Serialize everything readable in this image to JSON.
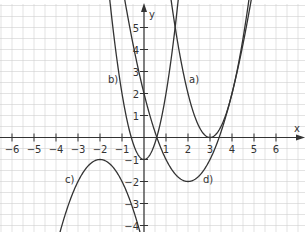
{
  "chart_data": {
    "type": "line",
    "title": "",
    "xlabel": "x",
    "ylabel": "y",
    "xlim": [
      -6.5,
      7
    ],
    "ylim": [
      -4.2,
      6
    ],
    "grid": true,
    "grid_step": 0.5,
    "x_ticks": [
      -6,
      -5,
      -4,
      -3,
      -2,
      -1,
      1,
      2,
      3,
      4,
      5,
      6
    ],
    "y_ticks": [
      -4,
      -3,
      -2,
      -1,
      1,
      2,
      3,
      4,
      5
    ],
    "x_tick_labels": [
      "−6",
      "−5",
      "−4",
      "−3",
      "−2",
      "−1",
      "1",
      "2",
      "3",
      "4",
      "5",
      "6"
    ],
    "y_tick_labels": [
      "−4",
      "−3",
      "−2",
      "−1",
      "1",
      "2",
      "3",
      "4",
      "5"
    ],
    "series": [
      {
        "name": "a)",
        "kind": "parabola",
        "vertex": [
          3,
          0
        ],
        "opens": "up",
        "formula": "y = 2(x-3)^2",
        "points": [
          [
            1.35,
            5.45
          ],
          [
            2,
            2
          ],
          [
            3,
            0
          ],
          [
            4,
            2
          ],
          [
            4.65,
            5.45
          ]
        ]
      },
      {
        "name": "b)",
        "kind": "parabola",
        "vertex": [
          0,
          -1
        ],
        "opens": "up",
        "formula": "y = 3x^2 - 1",
        "points": [
          [
            -1.45,
            5.3
          ],
          [
            -1,
            2
          ],
          [
            0,
            -1
          ],
          [
            1,
            2
          ],
          [
            1.45,
            5.3
          ]
        ]
      },
      {
        "name": "c)",
        "kind": "parabola",
        "vertex": [
          -2,
          -1
        ],
        "opens": "down",
        "formula": "y = -(x+2)^2 - 1",
        "points": [
          [
            -3.8,
            -4.24
          ],
          [
            -3,
            -2
          ],
          [
            -2,
            -1
          ],
          [
            -1,
            -2
          ],
          [
            -0.2,
            -4.24
          ]
        ]
      },
      {
        "name": "d)",
        "kind": "parabola",
        "vertex": [
          2,
          -2
        ],
        "opens": "up",
        "formula": "y = (x-2)^2 - 2",
        "points": [
          [
            -0.4,
            3.76
          ],
          [
            0,
            2
          ],
          [
            0.59,
            0
          ],
          [
            2,
            -2
          ],
          [
            3.41,
            0
          ],
          [
            4.7,
            5.29
          ]
        ]
      }
    ],
    "annotations": [
      {
        "text": "a)",
        "x": 2.2,
        "y": 2.6
      },
      {
        "text": "b)",
        "x": -1.1,
        "y": 2.6
      },
      {
        "text": "c)",
        "x": -3.4,
        "y": -2
      },
      {
        "text": "d)",
        "x": 2.9,
        "y": -1.9
      }
    ]
  },
  "axes": {
    "x_label": "x",
    "y_label": "y",
    "axis_color": "#333333",
    "grid_color": "#d0d0d0",
    "curve_color": "#333333"
  },
  "labels": {
    "a": "a)",
    "b": "b)",
    "c": "c)",
    "d": "d)"
  }
}
